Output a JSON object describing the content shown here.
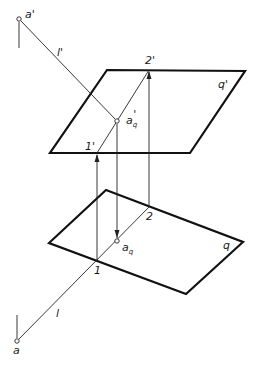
{
  "diagram": {
    "type": "descriptive-geometry-projection",
    "colors": {
      "line": "#111111",
      "background": "#ffffff"
    },
    "planes": [
      {
        "id": "q_prime",
        "label": "q'",
        "corners": [
          [
            107,
            70
          ],
          [
            245,
            71
          ],
          [
            190,
            153
          ],
          [
            50,
            153
          ]
        ]
      },
      {
        "id": "q",
        "label": "q",
        "corners": [
          [
            106,
            190
          ],
          [
            243,
            242
          ],
          [
            186,
            294
          ],
          [
            49,
            243
          ]
        ]
      }
    ],
    "lines": [
      {
        "id": "l_prime",
        "label": "l'",
        "from": [
          19,
          19
        ],
        "to": [
          117,
          121
        ]
      },
      {
        "id": "l",
        "label": "l",
        "from": [
          17,
          341
        ],
        "to": [
          149,
          207
        ]
      },
      {
        "id": "trace_upper",
        "from": [
          97,
          153
        ],
        "to": [
          149,
          70
        ]
      }
    ],
    "projectors": [
      {
        "id": "proj_1",
        "from": [
          97,
          260
        ],
        "to": [
          97,
          153
        ],
        "arrow": "up"
      },
      {
        "id": "proj_aq",
        "from": [
          117,
          121
        ],
        "to": [
          117,
          241
        ],
        "arrow": "down"
      },
      {
        "id": "proj_2",
        "from": [
          149,
          207
        ],
        "to": [
          149,
          70
        ],
        "arrow": "up"
      }
    ],
    "points": [
      {
        "id": "a_prime",
        "label": "a'",
        "pos": [
          19,
          19
        ]
      },
      {
        "id": "a_q_prime",
        "label": "a'q",
        "pos": [
          117,
          121
        ]
      },
      {
        "id": "a_q",
        "label": "aq",
        "pos": [
          117,
          241
        ]
      },
      {
        "id": "a",
        "label": "a",
        "pos": [
          17,
          341
        ]
      }
    ],
    "labels": {
      "a_prime": "a'",
      "l_prime": "l'",
      "two_prime": "2'",
      "q_prime": "q'",
      "a_q_prime_main": "a",
      "a_q_prime_sub": "q",
      "a_q_prime_mark": "'",
      "one_prime": "1'",
      "two": "2",
      "a_q_main": "a",
      "a_q_sub": "q",
      "q": "q",
      "one": "1",
      "l": "l",
      "a": "a"
    }
  }
}
